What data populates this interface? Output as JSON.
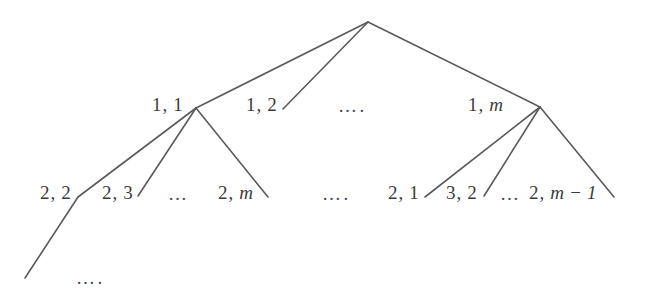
{
  "figure": {
    "type": "tree-diagram",
    "title": "",
    "background_color": "#ffffff",
    "line_color": "#5a5a5a",
    "text_color": "#3b3b3b",
    "width": 650,
    "height": 293
  },
  "labels": {
    "level1": [
      {
        "id": "1-1",
        "text": "1, 1",
        "prefix": "1,",
        "suffix": "1"
      },
      {
        "id": "1-2",
        "text": "1, 2",
        "prefix": "1,",
        "suffix": "2"
      },
      {
        "id": "1-m",
        "text": "1, m",
        "prefix": "1,",
        "suffix": "m"
      }
    ],
    "level2": [
      {
        "id": "2-2",
        "text": "2, 2",
        "prefix": "2,",
        "suffix": "2"
      },
      {
        "id": "2-3",
        "text": "2, 3",
        "prefix": "2,",
        "suffix": "3"
      },
      {
        "id": "2-m",
        "text": "2, m",
        "prefix": "2,",
        "suffix": "m"
      },
      {
        "id": "2-1",
        "text": "2, 1",
        "prefix": "2,",
        "suffix": "1"
      },
      {
        "id": "3-2",
        "text": "3, 2",
        "prefix": "3,",
        "suffix": "2"
      },
      {
        "id": "2-m-1",
        "text": "2, m − 1",
        "prefix": "2,",
        "suffix": "m − 1"
      }
    ],
    "ellipses": [
      {
        "id": "level1-mid",
        "text": "…."
      },
      {
        "id": "level2-left-inner",
        "text": "…"
      },
      {
        "id": "level2-mid",
        "text": "…."
      },
      {
        "id": "level2-right-inner",
        "text": "…"
      },
      {
        "id": "bottom-left",
        "text": "…."
      }
    ]
  },
  "geometry": {
    "root": {
      "x": 368,
      "y": 22
    },
    "nodes_level1": [
      {
        "id": "1-1",
        "x": 196,
        "y": 108
      },
      {
        "id": "1-2",
        "x": 283,
        "y": 109
      },
      {
        "id": "1-m",
        "x": 540,
        "y": 107
      }
    ],
    "edges_root": [
      {
        "from": "root",
        "to": "1-1"
      },
      {
        "from": "root",
        "to": "1-2"
      },
      {
        "from": "root",
        "to": "1-m"
      }
    ],
    "edges_left": [
      {
        "from": "1-1",
        "to_x": 78,
        "to_y": 197
      },
      {
        "from": "1-1",
        "to_x": 138,
        "to_y": 196
      },
      {
        "from": "1-1",
        "to_x": 268,
        "to_y": 197
      }
    ],
    "edges_right": [
      {
        "from": "1-m",
        "to_x": 425,
        "to_y": 197
      },
      {
        "from": "1-m",
        "to_x": 484,
        "to_y": 196
      },
      {
        "from": "1-m",
        "to_x": 614,
        "to_y": 197
      }
    ],
    "edge_tail": {
      "from_x": 78,
      "from_y": 197,
      "to_x": 25,
      "to_y": 278
    }
  }
}
